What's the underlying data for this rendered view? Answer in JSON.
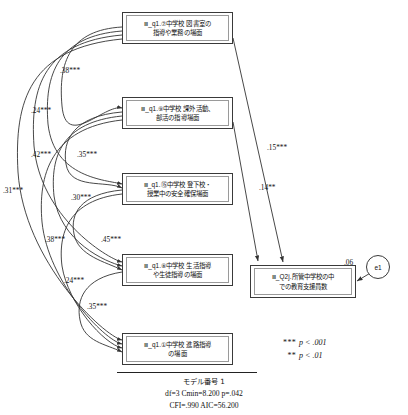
{
  "diagram": {
    "type": "structural-equation-model-path-diagram",
    "title_note": "モデル番号 1"
  },
  "nodes": {
    "exogenous": [
      {
        "id": "q1_7",
        "label": "Ⅲ_q1.⑦中学校 図書室の\n指導や業務の場面"
      },
      {
        "id": "q1_9",
        "label": "Ⅲ_q1.⑨中学校 課外活動、\n部活の指導場面"
      },
      {
        "id": "q1_15",
        "label": "Ⅲ_q1.⑮中学校 登下校・\n授業中の安全確保場面"
      },
      {
        "id": "q1_8",
        "label": "Ⅲ_q1.⑧中学校 生活指導\nや生徒指導の場面"
      },
      {
        "id": "q1_1",
        "label": "Ⅲ_q1.①中学校 進路指導\nの場面"
      }
    ],
    "endogenous": {
      "id": "Q2j",
      "label": "Ⅲ_Q2j.所管中学校の中\nでの教育支援員数",
      "r_squared": ".06"
    },
    "error": {
      "id": "e1",
      "label": "e1"
    }
  },
  "paths": [
    {
      "from": "q1_7",
      "to": "Q2j",
      "coef": ".15",
      "stars": "***"
    },
    {
      "from": "q1_9",
      "to": "Q2j",
      "coef": ".14",
      "stars": "**"
    }
  ],
  "correlations": [
    {
      "pair": "q1_7-q1_9",
      "coef": ".38",
      "stars": "***"
    },
    {
      "pair": "q1_7-q1_15",
      "coef": ".24",
      "stars": "***"
    },
    {
      "pair": "q1_7-q1_8",
      "coef": ".42",
      "stars": "***"
    },
    {
      "pair": "q1_9-q1_15",
      "coef": ".35",
      "stars": "***"
    },
    {
      "pair": "q1_7-q1_1",
      "coef": ".31",
      "stars": "***"
    },
    {
      "pair": "q1_9-q1_8",
      "coef": ".30",
      "stars": "***"
    },
    {
      "pair": "q1_9-q1_1",
      "coef": ".38",
      "stars": "***"
    },
    {
      "pair": "q1_15-q1_8",
      "coef": ".45",
      "stars": "***"
    },
    {
      "pair": "q1_15-q1_1",
      "coef": ".24",
      "stars": "***"
    },
    {
      "pair": "q1_8-q1_1",
      "coef": ".35",
      "stars": "***"
    }
  ],
  "legend": {
    "line1_stars": "***",
    "line1_text": "p < .001",
    "line2_stars": "**",
    "line2_text": "p < .01"
  },
  "fit": {
    "model_label": "モデル番号 1",
    "line1": "df=3   Cmin=8.200   p=.042",
    "line2": "CFI=.990   AIC=56.200"
  }
}
